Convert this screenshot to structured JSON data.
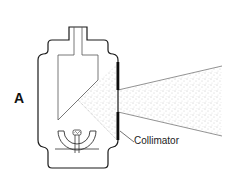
{
  "figure": {
    "panel_label": "A",
    "callouts": {
      "collimator": "Collimator"
    },
    "components": [
      "tube-housing",
      "anode",
      "cathode-filament",
      "focusing-cup",
      "collimator",
      "x-ray-beam"
    ],
    "colors": {
      "line": "#1a1a1a",
      "collimator": "#0d0d0d",
      "beam_stipple": "#888888",
      "background": "#ffffff"
    }
  }
}
